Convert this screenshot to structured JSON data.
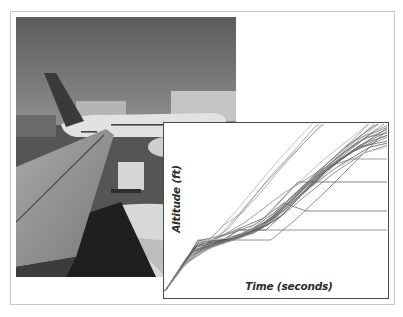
{
  "figure": {
    "photo": {
      "description": "airport ramp view from aircraft wing, airliner parked at terminal",
      "subject": "airplane-wing-photo"
    },
    "chart": {
      "xlabel": "Time (seconds)",
      "ylabel": "Altitude (ft)"
    }
  },
  "chart_data": {
    "type": "line",
    "title": "",
    "xlabel": "Time (seconds)",
    "ylabel": "Altitude (ft)",
    "grid": false,
    "legend": null,
    "axis_ticks": "none (unlabeled axes)",
    "note": "Many overlapping climb trajectories (approx. 30+ flights) in gray; coordinates in chart-local pixels (x: 0-224 left->right = time, y: 0-175 top->bottom = altitude inverted). Common early level-off plateau near y=117; later level-offs at y=36, 59, 88.",
    "series": [
      {
        "name": "flight-01",
        "color": "#6a6a6a",
        "points": [
          [
            1,
            168
          ],
          [
            20,
            140
          ],
          [
            34,
            117
          ],
          [
            107,
            117
          ],
          [
            130,
            98
          ],
          [
            160,
            70
          ],
          [
            190,
            40
          ],
          [
            220,
            10
          ]
        ]
      },
      {
        "name": "flight-02",
        "color": "#555555",
        "points": [
          [
            1,
            168
          ],
          [
            25,
            132
          ],
          [
            34,
            118
          ],
          [
            60,
            112
          ],
          [
            100,
            95
          ],
          [
            134,
            59
          ],
          [
            224,
            59
          ]
        ]
      },
      {
        "name": "flight-03",
        "color": "#5c5c5c",
        "points": [
          [
            1,
            168
          ],
          [
            30,
            125
          ],
          [
            50,
            116
          ],
          [
            90,
            102
          ],
          [
            120,
            80
          ],
          [
            142,
            88
          ],
          [
            224,
            88
          ]
        ]
      },
      {
        "name": "flight-04",
        "color": "#7a7a7a",
        "points": [
          [
            1,
            168
          ],
          [
            22,
            135
          ],
          [
            45,
            120
          ],
          [
            80,
            100
          ],
          [
            120,
            70
          ],
          [
            160,
            45
          ],
          [
            187,
            36
          ],
          [
            224,
            36
          ]
        ]
      },
      {
        "name": "flight-05",
        "color": "#9a9a9a",
        "points": [
          [
            1,
            168
          ],
          [
            15,
            148
          ],
          [
            35,
            128
          ],
          [
            60,
            108
          ],
          [
            80,
            85
          ],
          [
            100,
            62
          ],
          [
            125,
            35
          ],
          [
            150,
            10
          ],
          [
            160,
            1
          ]
        ]
      },
      {
        "name": "flight-06",
        "color": "#8a8a8a",
        "points": [
          [
            1,
            168
          ],
          [
            18,
            145
          ],
          [
            40,
            125
          ],
          [
            65,
            105
          ],
          [
            85,
            80
          ],
          [
            105,
            55
          ],
          [
            130,
            28
          ],
          [
            150,
            5
          ],
          [
            155,
            1
          ]
        ]
      },
      {
        "name": "flight-07",
        "color": "#4e4e4e",
        "points": [
          [
            1,
            168
          ],
          [
            28,
            130
          ],
          [
            55,
            118
          ],
          [
            85,
            108
          ],
          [
            110,
            90
          ],
          [
            140,
            62
          ],
          [
            170,
            40
          ],
          [
            200,
            20
          ],
          [
            224,
            5
          ]
        ]
      },
      {
        "name": "flight-08",
        "color": "#666666",
        "points": [
          [
            1,
            168
          ],
          [
            26,
            134
          ],
          [
            50,
            122
          ],
          [
            80,
            112
          ],
          [
            105,
            98
          ],
          [
            130,
            72
          ],
          [
            160,
            48
          ],
          [
            190,
            28
          ],
          [
            224,
            14
          ]
        ]
      },
      {
        "name": "flight-09",
        "color": "#777777",
        "points": [
          [
            1,
            168
          ],
          [
            24,
            138
          ],
          [
            48,
            124
          ],
          [
            76,
            115
          ],
          [
            104,
            100
          ],
          [
            128,
            78
          ],
          [
            152,
            52
          ],
          [
            180,
            30
          ],
          [
            210,
            8
          ],
          [
            220,
            1
          ]
        ]
      },
      {
        "name": "flight-10",
        "color": "#5a5a5a",
        "points": [
          [
            1,
            168
          ],
          [
            30,
            128
          ],
          [
            58,
            120
          ],
          [
            90,
            110
          ],
          [
            118,
            92
          ],
          [
            145,
            65
          ],
          [
            175,
            38
          ],
          [
            205,
            18
          ],
          [
            224,
            8
          ]
        ]
      },
      {
        "name": "flight-11",
        "color": "#858585",
        "points": [
          [
            1,
            168
          ],
          [
            32,
            124
          ],
          [
            62,
            118
          ],
          [
            95,
            106
          ],
          [
            122,
            85
          ],
          [
            150,
            58
          ],
          [
            178,
            30
          ],
          [
            200,
            10
          ],
          [
            210,
            1
          ]
        ]
      },
      {
        "name": "flight-12",
        "color": "#6f6f6f",
        "points": [
          [
            1,
            168
          ],
          [
            27,
            132
          ],
          [
            52,
            121
          ],
          [
            75,
            107
          ],
          [
            238,
            107
          ]
        ]
      },
      {
        "name": "flight-13",
        "color": "#636363",
        "points": [
          [
            1,
            168
          ],
          [
            29,
            129
          ],
          [
            56,
            119
          ],
          [
            75,
            107
          ],
          [
            102,
            107
          ],
          [
            120,
            90
          ],
          [
            148,
            60
          ],
          [
            176,
            35
          ],
          [
            205,
            12
          ],
          [
            224,
            4
          ]
        ]
      },
      {
        "name": "flight-14",
        "color": "#909090",
        "points": [
          [
            1,
            168
          ],
          [
            20,
            142
          ],
          [
            44,
            126
          ],
          [
            70,
            116
          ],
          [
            100,
            104
          ],
          [
            126,
            82
          ],
          [
            154,
            55
          ],
          [
            182,
            28
          ],
          [
            208,
            6
          ],
          [
            215,
            1
          ]
        ]
      },
      {
        "name": "flight-15",
        "color": "#535353",
        "points": [
          [
            1,
            168
          ],
          [
            33,
            122
          ],
          [
            64,
            116
          ],
          [
            96,
            104
          ],
          [
            124,
            80
          ],
          [
            152,
            50
          ],
          [
            184,
            22
          ],
          [
            210,
            3
          ],
          [
            214,
            1
          ]
        ]
      },
      {
        "name": "flight-16",
        "color": "#7f7f7f",
        "points": [
          [
            1,
            168
          ],
          [
            36,
            120
          ],
          [
            70,
            114
          ],
          [
            100,
            100
          ],
          [
            128,
            74
          ],
          [
            158,
            45
          ],
          [
            190,
            18
          ],
          [
            224,
            2
          ]
        ]
      },
      {
        "name": "flight-17",
        "color": "#6b6b6b",
        "points": [
          [
            1,
            168
          ],
          [
            31,
            126
          ],
          [
            60,
            119
          ],
          [
            92,
            108
          ],
          [
            116,
            94
          ],
          [
            138,
            72
          ],
          [
            166,
            44
          ],
          [
            196,
            22
          ],
          [
            224,
            12
          ]
        ]
      },
      {
        "name": "flight-18",
        "color": "#a5a5a5",
        "points": [
          [
            1,
            168
          ],
          [
            23,
            137
          ],
          [
            46,
            125
          ],
          [
            74,
            113
          ],
          [
            102,
            94
          ],
          [
            130,
            64
          ],
          [
            158,
            38
          ],
          [
            188,
            14
          ],
          [
            205,
            1
          ]
        ]
      },
      {
        "name": "flight-19",
        "color": "#5f5f5f",
        "points": [
          [
            1,
            168
          ],
          [
            34,
            121
          ],
          [
            66,
            117
          ],
          [
            98,
            103
          ],
          [
            126,
            78
          ],
          [
            156,
            52
          ],
          [
            186,
            30
          ],
          [
            214,
            16
          ],
          [
            224,
            12
          ]
        ]
      },
      {
        "name": "flight-20",
        "color": "#8c8c8c",
        "points": [
          [
            1,
            168
          ],
          [
            28,
            131
          ],
          [
            54,
            120
          ],
          [
            84,
            109
          ],
          [
            112,
            92
          ],
          [
            138,
            66
          ],
          [
            168,
            36
          ],
          [
            196,
            10
          ],
          [
            204,
            1
          ]
        ]
      },
      {
        "name": "flight-21",
        "color": "#595959",
        "points": [
          [
            1,
            168
          ],
          [
            35,
            119
          ],
          [
            68,
            116
          ],
          [
            104,
            102
          ],
          [
            132,
            76
          ],
          [
            162,
            48
          ],
          [
            194,
            24
          ],
          [
            224,
            18
          ]
        ]
      },
      {
        "name": "flight-22",
        "color": "#757575",
        "points": [
          [
            1,
            168
          ],
          [
            26,
            133
          ],
          [
            51,
            122
          ],
          [
            82,
            110
          ],
          [
            110,
            94
          ],
          [
            136,
            70
          ],
          [
            164,
            42
          ],
          [
            192,
            20
          ],
          [
            224,
            6
          ]
        ]
      },
      {
        "name": "flight-23",
        "color": "#b0b0b0",
        "points": [
          [
            1,
            168
          ],
          [
            12,
            152
          ],
          [
            30,
            130
          ],
          [
            52,
            110
          ],
          [
            72,
            88
          ],
          [
            92,
            64
          ],
          [
            112,
            40
          ],
          [
            132,
            18
          ],
          [
            148,
            1
          ]
        ]
      },
      {
        "name": "flight-24",
        "color": "#969696",
        "points": [
          [
            1,
            168
          ],
          [
            16,
            146
          ],
          [
            38,
            124
          ],
          [
            60,
            102
          ],
          [
            78,
            90
          ],
          [
            98,
            68
          ],
          [
            118,
            44
          ],
          [
            140,
            20
          ],
          [
            158,
            1
          ]
        ]
      },
      {
        "name": "flight-25",
        "color": "#4a4a4a",
        "points": [
          [
            1,
            168
          ],
          [
            32,
            124
          ],
          [
            62,
            117
          ],
          [
            94,
            106
          ],
          [
            120,
            88
          ],
          [
            146,
            64
          ],
          [
            176,
            42
          ],
          [
            206,
            24
          ],
          [
            224,
            20
          ]
        ]
      },
      {
        "name": "flight-26",
        "color": "#686868",
        "points": [
          [
            1,
            168
          ],
          [
            30,
            127
          ],
          [
            58,
            119
          ],
          [
            88,
            110
          ],
          [
            114,
            96
          ],
          [
            140,
            74
          ],
          [
            170,
            50
          ],
          [
            200,
            30
          ],
          [
            224,
            22
          ]
        ]
      },
      {
        "name": "flight-27",
        "color": "#c0c0c0",
        "points": [
          [
            1,
            168
          ],
          [
            38,
            118
          ],
          [
            72,
            114
          ],
          [
            108,
            98
          ],
          [
            138,
            72
          ],
          [
            170,
            46
          ],
          [
            200,
            30
          ],
          [
            224,
            24
          ]
        ]
      },
      {
        "name": "flight-28",
        "color": "#6d6d6d",
        "points": [
          [
            1,
            168
          ],
          [
            29,
            128
          ],
          [
            57,
            120
          ],
          [
            87,
            108
          ],
          [
            115,
            90
          ],
          [
            143,
            62
          ],
          [
            173,
            34
          ],
          [
            203,
            14
          ],
          [
            224,
            10
          ]
        ]
      }
    ]
  }
}
